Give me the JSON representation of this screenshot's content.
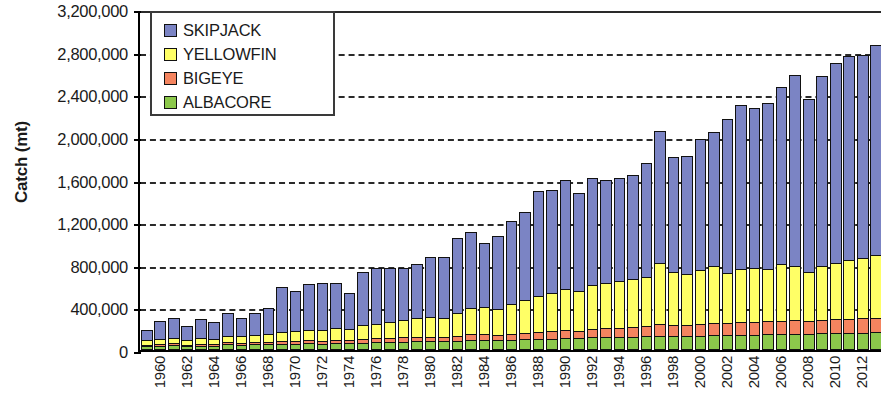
{
  "chart_data": {
    "type": "bar",
    "stacked": true,
    "title": "",
    "xlabel": "",
    "ylabel": "Catch (mt)",
    "ylim": [
      0,
      3200000
    ],
    "ytick_step": 400000,
    "ytick_labels": [
      "0",
      "400,000",
      "800,000",
      "1,200,000",
      "1,600,000",
      "2,000,000",
      "2,400,000",
      "2,800,000",
      "3,200,000"
    ],
    "ytick_values": [
      0,
      400000,
      800000,
      1200000,
      1600000,
      2000000,
      2400000,
      2800000,
      3200000
    ],
    "grid": true,
    "grid_axis": "y",
    "legend_position": "top-left",
    "xtick_label_interval": 2,
    "xtick_rotation": -90,
    "categories": [
      "1960",
      "1961",
      "1962",
      "1963",
      "1964",
      "1965",
      "1966",
      "1967",
      "1968",
      "1969",
      "1970",
      "1971",
      "1972",
      "1973",
      "1974",
      "1975",
      "1976",
      "1977",
      "1978",
      "1979",
      "1980",
      "1981",
      "1982",
      "1983",
      "1984",
      "1985",
      "1986",
      "1987",
      "1988",
      "1989",
      "1990",
      "1991",
      "1992",
      "1993",
      "1994",
      "1995",
      "1996",
      "1997",
      "1998",
      "1999",
      "2000",
      "2001",
      "2002",
      "2003",
      "2004",
      "2005",
      "2006",
      "2007",
      "2008",
      "2009",
      "2010",
      "2011",
      "2012",
      "2013",
      "2014"
    ],
    "xtick_labels_shown": [
      "1960",
      "1962",
      "1964",
      "1966",
      "1968",
      "1970",
      "1972",
      "1974",
      "1976",
      "1978",
      "1980",
      "1982",
      "1984",
      "1986",
      "1988",
      "1990",
      "1992",
      "1994",
      "1996",
      "1998",
      "2000",
      "2002",
      "2004",
      "2006",
      "2008",
      "2010",
      "2012",
      "2014"
    ],
    "series": [
      {
        "name": "ALBACORE",
        "color": "#8CC84B",
        "values": [
          38000,
          42000,
          45000,
          38000,
          42000,
          40000,
          52000,
          48000,
          52000,
          55000,
          58000,
          60000,
          62000,
          60000,
          64000,
          62000,
          70000,
          72000,
          75000,
          78000,
          80000,
          82000,
          80000,
          85000,
          95000,
          98000,
          92000,
          98000,
          100000,
          105000,
          108000,
          112000,
          110000,
          118000,
          120000,
          122000,
          125000,
          128000,
          135000,
          132000,
          130000,
          135000,
          140000,
          138000,
          142000,
          145000,
          148000,
          150000,
          152000,
          150000,
          155000,
          158000,
          160000,
          162000,
          165000
        ]
      },
      {
        "name": "BIGEYE",
        "color": "#F4845F",
        "values": [
          22000,
          25000,
          26000,
          22000,
          25000,
          24000,
          30000,
          28000,
          30000,
          32000,
          34000,
          36000,
          38000,
          36000,
          40000,
          38000,
          44000,
          46000,
          48000,
          50000,
          52000,
          54000,
          52000,
          58000,
          62000,
          64000,
          60000,
          66000,
          70000,
          75000,
          78000,
          82000,
          80000,
          88000,
          92000,
          95000,
          100000,
          105000,
          118000,
          115000,
          112000,
          118000,
          125000,
          122000,
          128000,
          130000,
          132000,
          135000,
          138000,
          130000,
          135000,
          140000,
          142000,
          145000,
          148000
        ]
      },
      {
        "name": "YELLOWFIN",
        "color": "#FFFF66",
        "values": [
          52000,
          58000,
          62000,
          55000,
          62000,
          60000,
          72000,
          70000,
          78000,
          85000,
          95000,
          100000,
          110000,
          108000,
          120000,
          118000,
          135000,
          145000,
          155000,
          170000,
          185000,
          195000,
          190000,
          225000,
          255000,
          265000,
          250000,
          290000,
          320000,
          350000,
          370000,
          400000,
          385000,
          420000,
          440000,
          450000,
          460000,
          470000,
          580000,
          500000,
          490000,
          520000,
          540000,
          480000,
          510000,
          515000,
          500000,
          540000,
          520000,
          470000,
          520000,
          540000,
          560000,
          580000,
          600000
        ]
      },
      {
        "name": "SKIPJACK",
        "color": "#7B84C4",
        "values": [
          108000,
          175000,
          197000,
          135000,
          191000,
          168000,
          218000,
          184000,
          220000,
          248000,
          433000,
          384000,
          440000,
          456000,
          436000,
          342000,
          511000,
          537000,
          522000,
          502000,
          523000,
          569000,
          578000,
          712000,
          728000,
          603000,
          698000,
          786000,
          830000,
          990000,
          974000,
          1026000,
          925000,
          1014000,
          968000,
          973000,
          985000,
          1077000,
          1247000,
          1093000,
          1118000,
          1237000,
          1265000,
          1460000,
          1550000,
          1510000,
          1570000,
          1675000,
          1800000,
          1630000,
          1790000,
          1882000,
          1928000,
          1913000,
          1977000
        ]
      }
    ],
    "totals": [
      220000,
      300000,
      330000,
      250000,
      320000,
      292000,
      372000,
      330000,
      380000,
      420000,
      620000,
      580000,
      650000,
      660000,
      660000,
      560000,
      760000,
      800000,
      800000,
      800000,
      840000,
      900000,
      900000,
      1080000,
      1140000,
      1030000,
      1100000,
      1240000,
      1320000,
      1520000,
      1530000,
      1620000,
      1500000,
      1640000,
      1620000,
      1640000,
      1670000,
      1780000,
      2080000,
      1840000,
      1850000,
      2010000,
      2070000,
      2200000,
      2330000,
      2300000,
      2350000,
      2500000,
      2610000,
      2380000,
      2600000,
      2720000,
      2790000,
      2800000,
      2890000
    ]
  }
}
